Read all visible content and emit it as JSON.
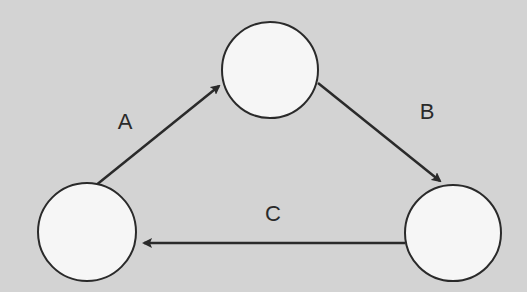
{
  "diagram": {
    "type": "cycle",
    "colors": {
      "background": "#d3d3d3",
      "node_fill": "#f6f6f6",
      "stroke": "#2a2a2a"
    },
    "nodes": [
      {
        "id": "top",
        "cx": 270,
        "cy": 70,
        "r": 48,
        "label": ""
      },
      {
        "id": "right",
        "cx": 453,
        "cy": 233,
        "r": 48,
        "label": ""
      },
      {
        "id": "left",
        "cx": 87,
        "cy": 232,
        "r": 49,
        "label": ""
      }
    ],
    "edges": [
      {
        "id": "A",
        "label": "A",
        "from": "left",
        "to": "top",
        "x1": 95,
        "y1": 186,
        "x2": 219,
        "y2": 86,
        "label_x": 125,
        "label_y": 122
      },
      {
        "id": "B",
        "label": "B",
        "from": "top",
        "to": "right",
        "x1": 318,
        "y1": 83,
        "x2": 440,
        "y2": 181,
        "label_x": 427,
        "label_y": 112
      },
      {
        "id": "C",
        "label": "C",
        "from": "right",
        "to": "left",
        "x1": 405,
        "y1": 243,
        "x2": 144,
        "y2": 243,
        "label_x": 273,
        "label_y": 214
      }
    ]
  }
}
